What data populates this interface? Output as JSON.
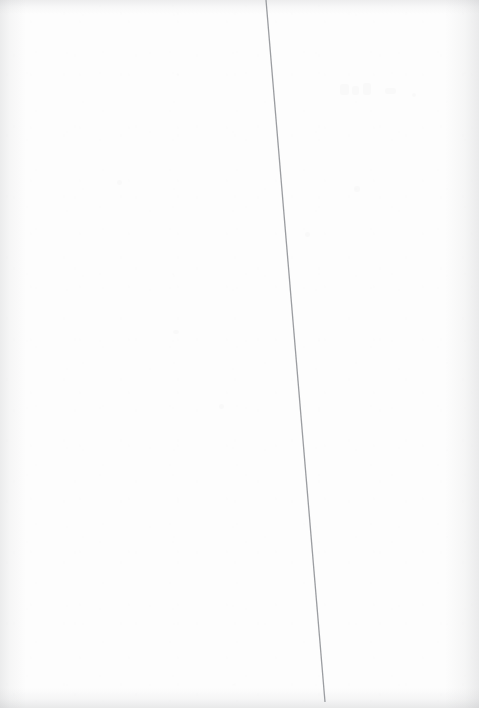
{
  "document": {
    "kind": "scanned-blank-page",
    "page_width": 479,
    "page_height": 708,
    "paper_color": "#fdfdfd",
    "visible_text": "",
    "text_blocks": [],
    "description": "Blank scanned page with a single thin near-vertical gray rule line and faint scanner edge shading."
  },
  "rule_line": {
    "name": "diagonal-rule-line",
    "color": "#8a8c90",
    "width_px": 1.3,
    "start": {
      "x": 266,
      "y": 0
    },
    "end": {
      "x": 325,
      "y": 702
    },
    "opacity": 0.85
  },
  "edge_shading": {
    "color": "#96989c",
    "left_width": 26,
    "right_width": 34,
    "top_height": 14,
    "bottom_height": 20
  },
  "ghost_marks": [
    {
      "x": 340,
      "y": 84,
      "w": 9,
      "h": 11
    },
    {
      "x": 352,
      "y": 86,
      "w": 7,
      "h": 9
    },
    {
      "x": 363,
      "y": 83,
      "w": 8,
      "h": 12
    },
    {
      "x": 385,
      "y": 88,
      "w": 11,
      "h": 6
    },
    {
      "x": 412,
      "y": 93,
      "w": 4,
      "h": 4
    },
    {
      "x": 117,
      "y": 180,
      "w": 5,
      "h": 5
    },
    {
      "x": 173,
      "y": 330,
      "w": 6,
      "h": 4
    },
    {
      "x": 219,
      "y": 404,
      "w": 5,
      "h": 5
    },
    {
      "x": 354,
      "y": 186,
      "w": 6,
      "h": 6
    },
    {
      "x": 305,
      "y": 232,
      "w": 5,
      "h": 5
    }
  ]
}
